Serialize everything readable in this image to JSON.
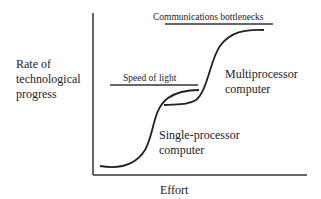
{
  "diagram": {
    "y_axis_label": [
      "Rate of",
      "technological",
      "progress"
    ],
    "x_axis_label": "Effort",
    "limits": [
      {
        "label": "Speed of light"
      },
      {
        "label": "Communications bottlenecks"
      }
    ],
    "curves": [
      {
        "label": [
          "Single-processor",
          "computer"
        ]
      },
      {
        "label": [
          "Multiprocessor",
          "computer"
        ]
      }
    ],
    "colors": {
      "ink": "#222222",
      "background": "#ffffff"
    }
  }
}
